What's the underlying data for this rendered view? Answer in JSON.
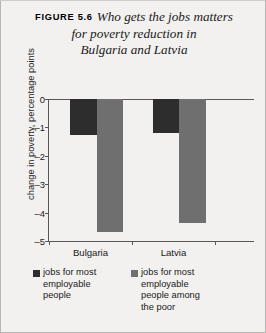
{
  "figure": {
    "label": "FIGURE 5.6",
    "title_lines": [
      "Who gets the jobs matters",
      "for poverty reduction in",
      "Bulgaria and Latvia"
    ],
    "title_full": "Who gets the jobs matters for poverty reduction in Bulgaria and Latvia"
  },
  "colors": {
    "series_dark": "#2d2d2d",
    "series_gray": "#6f6f6f",
    "axis": "#58585a",
    "background": "#f2f1ef",
    "text": "#1a1a1a"
  },
  "chart_data": {
    "type": "bar",
    "title": "Who gets the jobs matters for poverty reduction in Bulgaria and Latvia",
    "categories": [
      "Bulgaria",
      "Latvia"
    ],
    "series": [
      {
        "name": "jobs for most employable people",
        "color": "#2d2d2d",
        "values": [
          -1.25,
          -1.2
        ]
      },
      {
        "name": "jobs for most employable people among the poor",
        "color": "#6f6f6f",
        "values": [
          -4.7,
          -4.35
        ]
      }
    ],
    "xlabel": "",
    "ylabel": "change in poverty, percentage points",
    "ylim": [
      -5,
      0
    ],
    "yticks": [
      0,
      -1,
      -2,
      -3,
      -4,
      -5
    ],
    "ytick_labels": [
      "0",
      "–1",
      "–2",
      "–3",
      "–4",
      "–5"
    ],
    "grid": false,
    "legend_position": "bottom"
  },
  "legend": {
    "items": [
      {
        "label_lines": [
          "jobs for most",
          "employable",
          "people"
        ],
        "color": "#2d2d2d"
      },
      {
        "label_lines": [
          "jobs for most",
          "employable",
          "people among",
          "the poor"
        ],
        "color": "#6f6f6f"
      }
    ]
  }
}
